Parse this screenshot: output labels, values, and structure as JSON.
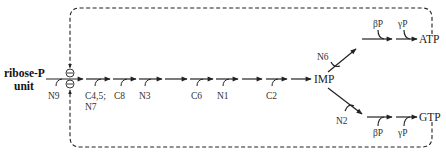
{
  "diagram": {
    "start_label_line1": "ribose-P",
    "start_label_line2": "unit",
    "inhibition_symbol": "⊖",
    "steps": [
      {
        "label": "N9"
      },
      {
        "label_line1": "C4,5;",
        "label_line2": "N7"
      },
      {
        "label": "C8"
      },
      {
        "label": "N3"
      },
      {
        "label": "C6"
      },
      {
        "label": "N1"
      },
      {
        "label": "C2"
      }
    ],
    "intermediate": "IMP",
    "branches": {
      "atp": {
        "entry_label": "N6",
        "phosphates": [
          "βP",
          "γP"
        ],
        "product": "ATP"
      },
      "gtp": {
        "entry_label": "N2",
        "phosphates": [
          "βP",
          "γP"
        ],
        "product": "GTP"
      }
    },
    "colors": {
      "line": "#222222",
      "text": "#333333"
    }
  }
}
